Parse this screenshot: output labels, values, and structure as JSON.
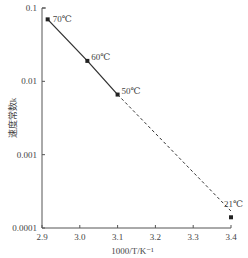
{
  "chart_data": {
    "type": "line",
    "title": "",
    "xlabel": "1000/T/K⁻¹",
    "ylabel": "速度常数k",
    "yscale": "log",
    "xlim": [
      2.9,
      3.4
    ],
    "ylim": [
      0.0001,
      0.1
    ],
    "grid": false,
    "x_ticks": [
      "2.9",
      "3.0",
      "3.1",
      "3.2",
      "3.3",
      "3.4"
    ],
    "y_ticks": [
      "0.1",
      "0.01",
      "0.001",
      "0.0001"
    ],
    "points": [
      {
        "label": "70℃",
        "x": 2.915,
        "y": 0.07
      },
      {
        "label": "60℃",
        "x": 3.02,
        "y": 0.019
      },
      {
        "label": "50℃",
        "x": 3.1,
        "y": 0.0066
      },
      {
        "label": "21℃",
        "x": 3.4,
        "y": 0.00014
      }
    ],
    "series": [
      {
        "name": "measured",
        "style": "solid",
        "points": [
          "70℃",
          "60℃",
          "50℃"
        ]
      },
      {
        "name": "extrapolated",
        "style": "dashed",
        "from": "50℃",
        "to_x": 3.4,
        "to_y": 0.00017
      }
    ]
  },
  "colors": {
    "line": "#333333",
    "axis": "#555555",
    "text": "#444444"
  }
}
